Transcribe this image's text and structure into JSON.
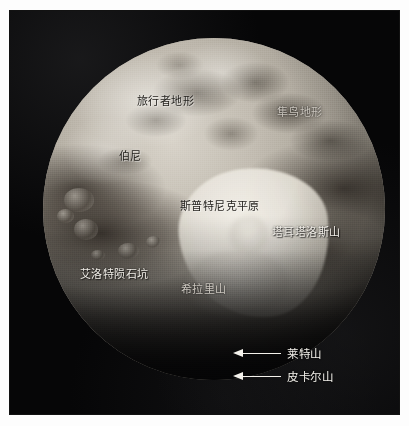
{
  "image": {
    "subject": "冥王星",
    "background_color": "#050505",
    "page_color": "#fdfdfd",
    "label_color": "#f2efe9",
    "arrow_color": "#f4f2ec"
  },
  "labels": [
    {
      "id": "voyager-terra",
      "text": "旅行者地形",
      "x": 137,
      "y": 95,
      "tone": "dark"
    },
    {
      "id": "hayabusa-terra",
      "text": "隼鸟地形",
      "x": 277,
      "y": 106,
      "tone": "dim"
    },
    {
      "id": "burney",
      "text": "伯尼",
      "x": 119,
      "y": 150,
      "tone": "dark"
    },
    {
      "id": "sputnik-planitia",
      "text": "斯普特尼克平原",
      "x": 180,
      "y": 200,
      "tone": "dark"
    },
    {
      "id": "tartarus-dorsa",
      "text": "塔耳塔洛斯山",
      "x": 272,
      "y": 226,
      "tone": "light"
    },
    {
      "id": "elliot-crater",
      "text": "艾洛特陨石坑",
      "x": 80,
      "y": 268,
      "tone": "light"
    },
    {
      "id": "hillary-montes",
      "text": "希拉里山",
      "x": 181,
      "y": 283,
      "tone": "dim"
    }
  ],
  "callouts": [
    {
      "id": "wright-mons",
      "text": "莱特山",
      "x": 233,
      "y": 345,
      "icon": "arrow-left-icon"
    },
    {
      "id": "piccard-mons",
      "text": "皮卡尔山",
      "x": 233,
      "y": 368,
      "icon": "arrow-left-icon"
    }
  ]
}
